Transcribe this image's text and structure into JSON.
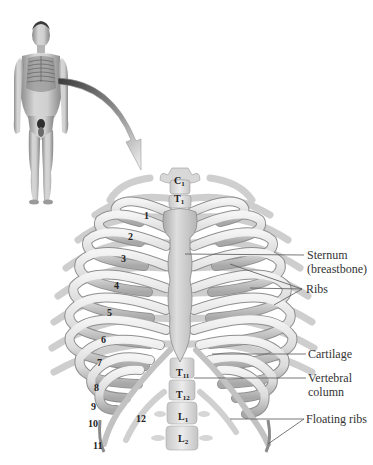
{
  "figure": {
    "inset": "Human figure with rib cage highlighted, arrow pointing to enlarged view"
  },
  "callouts": [
    {
      "id": "sternum",
      "line1": "Sternum",
      "line2": "(breastbone)"
    },
    {
      "id": "ribs",
      "line1": "Ribs"
    },
    {
      "id": "cartilage",
      "line1": "Cartilage"
    },
    {
      "id": "vertebral",
      "line1": "Vertebral",
      "line2": "column"
    },
    {
      "id": "floating",
      "line1": "Floating ribs"
    }
  ],
  "rib_numbers": [
    "1",
    "2",
    "3",
    "4",
    "5",
    "6",
    "7",
    "8",
    "9",
    "10",
    "11",
    "12"
  ],
  "vertebrae": [
    {
      "letter": "C",
      "sub": "1"
    },
    {
      "letter": "T",
      "sub": "1"
    },
    {
      "letter": "T",
      "sub": "11"
    },
    {
      "letter": "T",
      "sub": "12"
    },
    {
      "letter": "L",
      "sub": "1"
    },
    {
      "letter": "L",
      "sub": "2"
    }
  ],
  "colors": {
    "bone_light": "#ececec",
    "bone_mid": "#cfcfcf",
    "bone_dark": "#9a9a9a",
    "label_text": "#333333",
    "leader_line": "#555555"
  }
}
